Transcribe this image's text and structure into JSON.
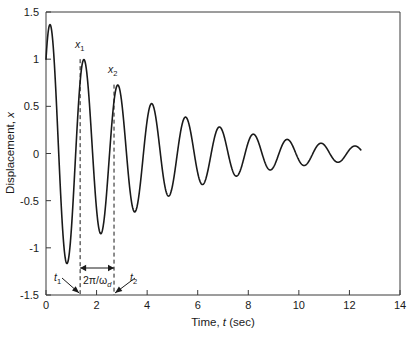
{
  "chart_data": {
    "type": "line",
    "title": "",
    "xlabel": "Time, t (sec)",
    "ylabel": "Displacement, x",
    "xlim": [
      0,
      14
    ],
    "ylim": [
      -1.5,
      1.5
    ],
    "xticks": [
      0,
      2,
      4,
      6,
      8,
      10,
      12,
      14
    ],
    "xticklabels": [
      "0",
      "2",
      "4",
      "6",
      "8",
      "10",
      "12",
      "14"
    ],
    "yticks": [
      -1.5,
      -1,
      -0.5,
      0,
      0.5,
      1,
      1.5
    ],
    "yticklabels": [
      "-1.5",
      "-1",
      "-0.5",
      "0",
      "0.5",
      "1",
      "1.5"
    ],
    "grid": false,
    "legend": "none",
    "series": [
      {
        "name": "damped free vibration",
        "description": "x(t) = A e^(-zeta*wn*t) sin(wd*t + phi), underdamped decay",
        "model": {
          "x0": 1.0,
          "amplitude": 1.42,
          "decay_rate_per_sec": 0.236,
          "damped_period_sec": 1.34,
          "damped_natural_freq_rad_per_sec": 4.69,
          "phase_rad": 0.78,
          "t_start": 0.0,
          "t_end": 12.45
        },
        "peaks_t": [
          0.25,
          1.35,
          2.69,
          3.92,
          5.22,
          6.45,
          7.68,
          8.95,
          10.25,
          11.52
        ],
        "peaks_x": [
          1.4,
          1.0,
          0.73,
          0.53,
          0.4,
          0.29,
          0.22,
          0.165,
          0.125,
          0.09
        ],
        "troughs_t": [
          0.8,
          2.05,
          3.26,
          4.55,
          5.82,
          7.08,
          8.33,
          9.6,
          10.88,
          12.15
        ],
        "troughs_x": [
          -1.17,
          -0.87,
          -0.62,
          -0.47,
          -0.34,
          -0.25,
          -0.185,
          -0.135,
          -0.1,
          -0.07
        ]
      }
    ],
    "annotations": [
      {
        "id": "x1",
        "label": "x",
        "sublabel": "1",
        "t": 1.35,
        "x": 1.0,
        "note": "first measured peak amplitude"
      },
      {
        "id": "x2",
        "label": "x",
        "sublabel": "2",
        "t": 2.69,
        "x": 0.73,
        "note": "second measured peak amplitude"
      },
      {
        "id": "t1",
        "label": "t",
        "sublabel": "1",
        "t": 1.35,
        "note": "time of first peak, arrow to x axis"
      },
      {
        "id": "t2",
        "label": "t",
        "sublabel": "2",
        "t": 2.69,
        "note": "time of second peak, arrow to x axis"
      },
      {
        "id": "period",
        "label": "2π/ω",
        "sublabel": "d",
        "t_from": 1.35,
        "t_to": 2.69,
        "note": "damped period double arrow"
      }
    ]
  },
  "labels": {
    "xaxis_prefix": "Time, ",
    "xaxis_italic": "t",
    "xaxis_suffix": " (sec)",
    "yaxis_prefix": "Displacement, ",
    "yaxis_italic": "x",
    "x1_base": "x",
    "x1_sub": "1",
    "x2_base": "x",
    "x2_sub": "2",
    "t1_base": "t",
    "t1_sub": "1",
    "t2_base": "t",
    "t2_sub": "2",
    "period_base": "2π/ω",
    "period_sub": "d"
  },
  "colors": {
    "curve": "#1a1a1a",
    "axis": "#3a3a3a",
    "text": "#1a1a1a",
    "background": "#ffffff"
  }
}
